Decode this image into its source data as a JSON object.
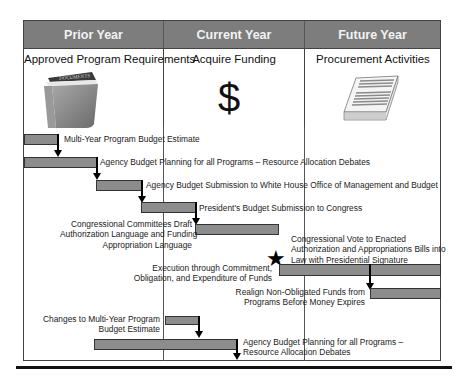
{
  "columns": [
    {
      "header": "Prior Year",
      "title": "Approved Program Requirements",
      "icon": "documents-folder-icon",
      "icon_label": "DOCUMENTS"
    },
    {
      "header": "Current Year",
      "title": "Acquire Funding",
      "icon": "dollar-sign-icon",
      "icon_glyph": "$"
    },
    {
      "header": "Future Year",
      "title": "Procurement Activities",
      "icon": "paper-stack-icon"
    }
  ],
  "steps": [
    {
      "label": "Multi-Year Program Budget Estimate"
    },
    {
      "label": "Agency Budget Planning for all Programs – Resource Allocation Debates"
    },
    {
      "label": "Agency Budget Submission to White House Office of Management and Budget"
    },
    {
      "label": "President's Budget Submission to Congress"
    },
    {
      "label_lines": [
        "Congressional Committees Draft",
        "Authorization Language and Funding",
        "Appropriation Language"
      ]
    },
    {
      "label_lines": [
        "Congressional Vote to Enacted",
        "Authorization and Appropriations Bills into",
        "Law with Presidential Signature"
      ],
      "marker": "star-icon"
    },
    {
      "label_lines": [
        "Execution through Commitment,",
        "Obligation, and Expenditure of Funds"
      ]
    },
    {
      "label_lines": [
        "Realign Non-Obligated Funds from",
        "Programs Before Money Expires"
      ]
    },
    {
      "label_lines": [
        "Changes to Multi-Year Program",
        "Budget Estimate"
      ]
    },
    {
      "label_lines": [
        "Agency Budget Planning for all Programs –",
        "Resource Allocation Debates"
      ]
    }
  ],
  "colors": {
    "header_bg": "#7d7d7d",
    "bar_fill": "#8c8c8c",
    "border": "#444444"
  }
}
